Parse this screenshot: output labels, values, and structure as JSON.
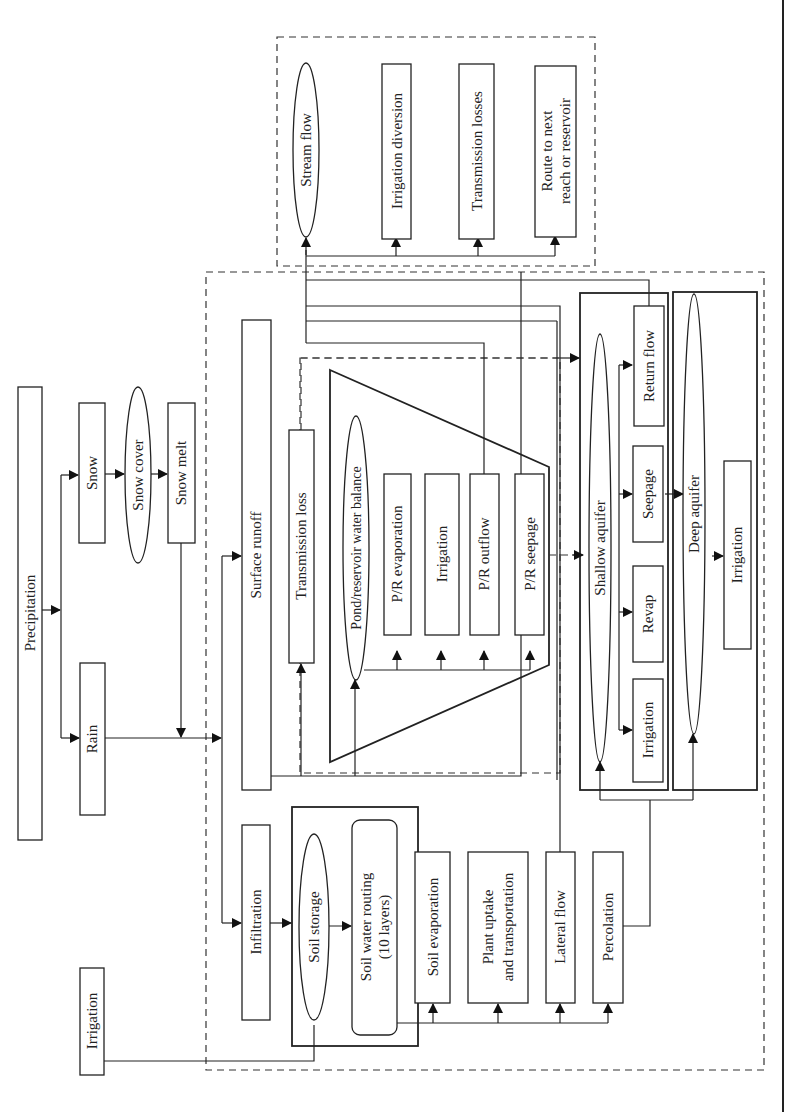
{
  "diagram": {
    "orientation": "rotated 90 degrees counter-clockwise",
    "nodes": {
      "precipitation": "Precipitation",
      "snow": "Snow",
      "snow_cover": "Snow cover",
      "snow_melt": "Snow melt",
      "rain": "Rain",
      "irrigation_input": "Irrigation",
      "surface_runoff": "Surface runoff",
      "infiltration": "Infiltration",
      "transmission_loss": "Transmission loss",
      "pond_balance": "Pond/reservoir water balance",
      "pr_evaporation": "P/R evaporation",
      "pr_irrigation": "Irrigation",
      "pr_outflow": "P/R outflow",
      "pr_seepage": "P/R seepage",
      "soil_storage": "Soil storage",
      "soil_routing_line1": "Soil water routing",
      "soil_routing_line2": "(10 layers)",
      "soil_evaporation": "Soil evaporation",
      "plant_uptake_line1": "Plant uptake",
      "plant_uptake_line2": "and transportation",
      "lateral_flow": "Lateral flow",
      "percolation": "Percolation",
      "shallow_aquifer": "Shallow aquifer",
      "sa_irrigation": "Irrigation",
      "revap": "Revap",
      "seepage": "Seepage",
      "return_flow": "Return flow",
      "deep_aquifer": "Deep aquifer",
      "da_irrigation": "Irrigation",
      "stream_flow": "Stream flow",
      "irrigation_diversion": "Irrigation diversion",
      "transmission_losses": "Transmission losses",
      "route_line1": "Route to next",
      "route_line2": "reach or reservoir"
    },
    "groups": [
      {
        "name": "land-phase",
        "style": "dashed"
      },
      {
        "name": "routing-phase",
        "style": "dashed"
      },
      {
        "name": "pond-reservoir",
        "style": "trapezoid"
      },
      {
        "name": "soil-profile",
        "style": "solid"
      },
      {
        "name": "shallow-aquifer-group",
        "style": "solid"
      },
      {
        "name": "deep-aquifer-group",
        "style": "solid"
      }
    ]
  }
}
